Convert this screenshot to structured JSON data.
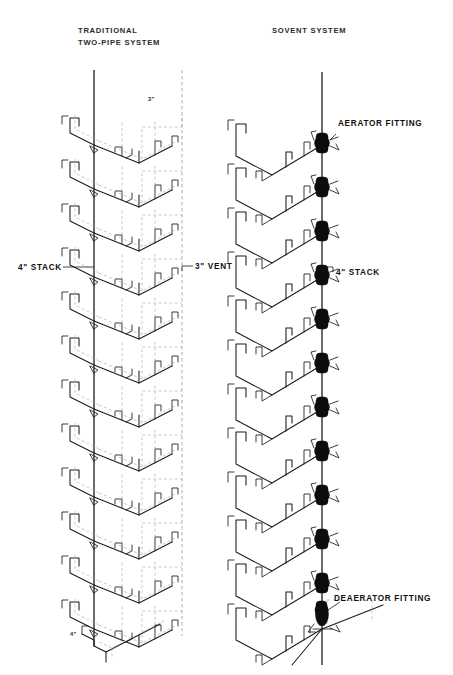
{
  "page": {
    "width": 453,
    "height": 675,
    "background": "#ffffff",
    "ink": "#1b1b1b",
    "vent_color": "#9a9a9a",
    "fitting_color": "#0d0d0d"
  },
  "titles": {
    "left_line1": "TRADITIONAL",
    "left_line2": "TWO-PIPE SYSTEM",
    "right": "SOVENT SYSTEM"
  },
  "left_system": {
    "name": "traditional-two-pipe-system",
    "floors": 13,
    "labels": {
      "stack": "4\" STACK",
      "vent": "3\" VENT",
      "vent_size_top": "3\"",
      "stack_size_bottom": "4\""
    }
  },
  "right_system": {
    "name": "sovent-system",
    "floors": 13,
    "aerator_count": 12,
    "deaerator_count": 1,
    "labels": {
      "aerator": "AERATOR  FITTING",
      "stack": "4\" STACK",
      "deaerator": "DEAERATOR  FITTING"
    }
  },
  "geometry": {
    "floor_pitch": 44,
    "left_stack_x": 94,
    "left_top_y": 70,
    "left_bottom_y": 650,
    "right_stack_x": 322,
    "right_top_y": 72,
    "right_bottom_y": 668,
    "first_fitting_y": 142,
    "deaerator_y": 618
  }
}
